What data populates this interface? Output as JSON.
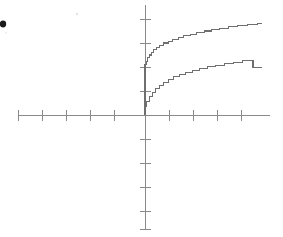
{
  "figure": {
    "width": 283,
    "height": 237,
    "background_color": "#ffffff",
    "axis_color": "#8a8a8a",
    "curve_color": "#6f6f6f",
    "marker_color": "#1a1a1a",
    "marker_name": "bullet-dot"
  },
  "chart_data": {
    "type": "line",
    "title": "",
    "subtitle": "",
    "xlabel": "",
    "ylabel": "",
    "grid": false,
    "legend": "none",
    "axes": {
      "style": "cartesian-cross",
      "origin_px": [
        145,
        115
      ],
      "x_axis_px": [
        18,
        270
      ],
      "y_axis_px": [
        5,
        230
      ],
      "x_tick_spacing_px": 24,
      "y_tick_spacing_px": 24,
      "x_tick_labels": [],
      "y_tick_labels": [],
      "xlim": [
        -5.3,
        5.2
      ],
      "ylim": [
        -4.8,
        4.6
      ]
    },
    "series": [
      {
        "name": "upper-step-curve",
        "style": "staircase",
        "description": "concave increasing step function, jumps from origin to a positive value then rises slowly",
        "x": [
          0.0,
          0.05,
          0.1,
          0.18,
          0.26,
          0.36,
          0.48,
          0.62,
          0.78,
          0.96,
          1.16,
          1.38,
          1.62,
          1.88,
          2.16,
          2.46,
          2.78,
          3.12,
          3.48,
          3.86,
          4.26,
          4.68,
          4.88
        ],
        "y": [
          0.0,
          2.1,
          2.24,
          2.38,
          2.5,
          2.62,
          2.72,
          2.82,
          2.91,
          3.0,
          3.08,
          3.16,
          3.23,
          3.3,
          3.37,
          3.44,
          3.5,
          3.56,
          3.62,
          3.68,
          3.74,
          3.79,
          3.8
        ]
      },
      {
        "name": "lower-step-curve",
        "style": "staircase",
        "description": "concave increasing step function rising from the origin",
        "x": [
          0.0,
          0.08,
          0.18,
          0.3,
          0.44,
          0.6,
          0.78,
          0.98,
          1.2,
          1.44,
          1.7,
          1.98,
          2.28,
          2.6,
          2.94,
          3.3,
          3.68,
          4.08,
          4.5,
          4.88
        ],
        "y": [
          0.0,
          0.36,
          0.58,
          0.78,
          0.95,
          1.1,
          1.24,
          1.37,
          1.48,
          1.59,
          1.69,
          1.78,
          1.86,
          1.94,
          2.01,
          2.08,
          2.14,
          2.2,
          2.26,
          1.98
        ]
      }
    ],
    "annotations": [
      {
        "name": "bullet-dot",
        "text": "",
        "position_px": [
          3,
          24
        ]
      }
    ]
  }
}
